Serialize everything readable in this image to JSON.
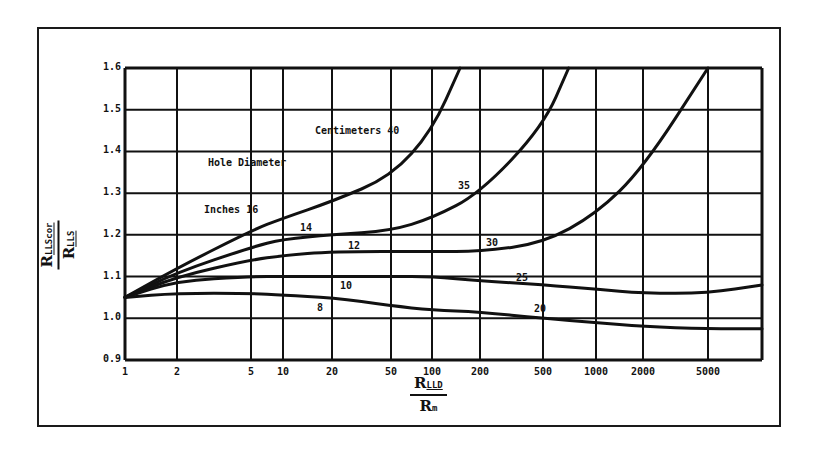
{
  "chart_data": {
    "type": "line",
    "title": "",
    "xlabel": "R_LLD / R_m",
    "ylabel": "R_LLScor / R_LLS",
    "x_scale": "log",
    "x_ticks": [
      1,
      2,
      5,
      10,
      20,
      50,
      100,
      200,
      500,
      1000,
      2000,
      5000
    ],
    "x_tick_labels": [
      "1",
      "2",
      "5",
      "10",
      "20",
      "50",
      "100",
      "200",
      "500",
      "1000",
      "2000",
      "5000"
    ],
    "y_ticks": [
      0.9,
      1.0,
      1.1,
      1.2,
      1.3,
      1.4,
      1.5,
      1.6
    ],
    "y_tick_labels": [
      "0.9",
      "1.0",
      "1.1",
      "1.2",
      "1.3",
      "1.4",
      "1.5",
      "1.6"
    ],
    "ylim": [
      0.9,
      1.6
    ],
    "xlim": [
      1,
      12000
    ],
    "grid": true,
    "legend": "none (curves labeled inline)",
    "annotations": [
      "Hole Diameter",
      "Inches",
      "Centimeters"
    ],
    "series": [
      {
        "name": "16 in / 40 cm",
        "inches": "16",
        "cm": "40",
        "x": [
          1,
          2,
          5,
          10,
          20,
          50,
          100,
          150
        ],
        "y": [
          1.05,
          1.12,
          1.21,
          1.24,
          1.28,
          1.34,
          1.45,
          1.6
        ]
      },
      {
        "name": "14 in / 35 cm",
        "inches": "14",
        "cm": "35",
        "x": [
          1,
          2,
          5,
          10,
          20,
          50,
          100,
          200,
          500,
          700
        ],
        "y": [
          1.05,
          1.11,
          1.17,
          1.19,
          1.2,
          1.21,
          1.24,
          1.3,
          1.46,
          1.6
        ]
      },
      {
        "name": "12 in / 30 cm",
        "inches": "12",
        "cm": "30",
        "x": [
          1,
          2,
          5,
          10,
          20,
          100,
          200,
          500,
          1000,
          2000,
          5000
        ],
        "y": [
          1.05,
          1.1,
          1.14,
          1.15,
          1.16,
          1.16,
          1.16,
          1.18,
          1.25,
          1.36,
          1.6
        ]
      },
      {
        "name": "10 in / 25 cm",
        "inches": "10",
        "cm": "25",
        "x": [
          1,
          2,
          5,
          10,
          50,
          100,
          200,
          500,
          1000,
          2000,
          5000,
          12000
        ],
        "y": [
          1.05,
          1.09,
          1.1,
          1.1,
          1.1,
          1.1,
          1.09,
          1.08,
          1.07,
          1.06,
          1.06,
          1.08
        ]
      },
      {
        "name": "8 in / 20 cm",
        "inches": "8",
        "cm": "20",
        "x": [
          1,
          2,
          5,
          10,
          20,
          50,
          100,
          200,
          500,
          1000,
          2000,
          5000,
          12000
        ],
        "y": [
          1.05,
          1.06,
          1.06,
          1.055,
          1.05,
          1.03,
          1.02,
          1.015,
          1.0,
          0.99,
          0.98,
          0.975,
          0.975
        ]
      }
    ]
  },
  "labels": {
    "y_num": "R",
    "y_num_sub": "LLScor",
    "y_den": "R",
    "y_den_sub": "LLS",
    "x_num": "R",
    "x_num_sub": "LLD",
    "x_den": "R",
    "x_den_sub": "m",
    "hole_diameter": "Hole Diameter",
    "inches": "Inches",
    "centimeters": "Centimeters",
    "c16": "16",
    "c14": "14",
    "c12": "12",
    "c10": "10",
    "c8": "8",
    "c40": "40",
    "c35": "35",
    "c30": "30",
    "c25": "25",
    "c20": "20"
  },
  "colors": {
    "ink": "#111111",
    "background": "#ffffff"
  }
}
